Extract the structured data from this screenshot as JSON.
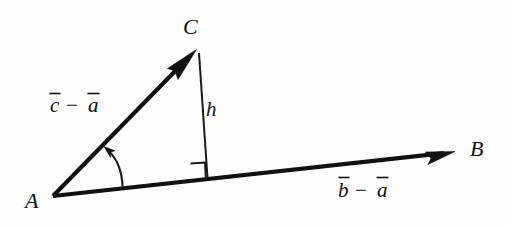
{
  "figure": {
    "type": "geometry-diagram",
    "background_color": "#fefefe",
    "ink_color": "#111111",
    "width": 511,
    "height": 226
  },
  "labels": {
    "vertex_a": "A",
    "vertex_b": "B",
    "vertex_c": "C",
    "altitude": "h",
    "vector_ac_base": "c",
    "vector_ac_minus": "−",
    "vector_ac_sub": "a",
    "vector_ab_base": "b",
    "vector_ab_minus": "−",
    "vector_ab_sub": "a"
  },
  "geometry": {
    "point_a": {
      "x": 53,
      "y": 196
    },
    "point_b_tip": {
      "x": 455,
      "y": 152
    },
    "point_c_tip": {
      "x": 196,
      "y": 50
    },
    "foot_of_altitude": {
      "x": 207,
      "y": 177
    },
    "altitude_top": {
      "x": 199,
      "y": 53
    },
    "angle_arc_start": {
      "x": 122,
      "y": 186
    },
    "angle_arc_end": {
      "x": 106,
      "y": 149
    },
    "right_angle_square_size": 15
  },
  "label_positions": {
    "vertex_a": {
      "x": 25,
      "y": 208
    },
    "vertex_b": {
      "x": 470,
      "y": 156
    },
    "vertex_c": {
      "x": 183,
      "y": 34
    },
    "altitude": {
      "x": 206,
      "y": 115
    },
    "vector_ac": {
      "x": 50,
      "y": 110
    },
    "vector_ab": {
      "x": 338,
      "y": 196
    }
  }
}
